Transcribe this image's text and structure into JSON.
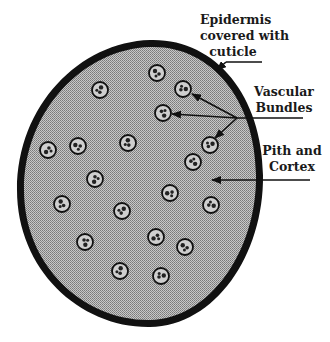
{
  "diagram": {
    "colors": {
      "epidermis": "#111111",
      "ground_tissue": "#a8a8a8",
      "bundle_fill": "#cfcfcf",
      "bundle_outline": "#111111",
      "text": "#1a1a1a"
    },
    "labels": {
      "epidermis": {
        "line1": "Epidermis",
        "line2": "covered with",
        "line3": "cuticle"
      },
      "vascular": {
        "line1": "Vascular",
        "line2": "Bundles"
      },
      "pith": {
        "line1": "Pith and",
        "line2": "Cortex"
      }
    },
    "vascular_bundles": [
      {
        "x": 157,
        "y": 73
      },
      {
        "x": 100,
        "y": 90
      },
      {
        "x": 183,
        "y": 89
      },
      {
        "x": 163,
        "y": 113
      },
      {
        "x": 48,
        "y": 150
      },
      {
        "x": 78,
        "y": 146
      },
      {
        "x": 128,
        "y": 143
      },
      {
        "x": 210,
        "y": 145
      },
      {
        "x": 193,
        "y": 162
      },
      {
        "x": 95,
        "y": 179
      },
      {
        "x": 170,
        "y": 193
      },
      {
        "x": 62,
        "y": 204
      },
      {
        "x": 122,
        "y": 211
      },
      {
        "x": 211,
        "y": 205
      },
      {
        "x": 85,
        "y": 242
      },
      {
        "x": 156,
        "y": 237
      },
      {
        "x": 185,
        "y": 247
      },
      {
        "x": 120,
        "y": 271
      },
      {
        "x": 161,
        "y": 276
      }
    ]
  }
}
